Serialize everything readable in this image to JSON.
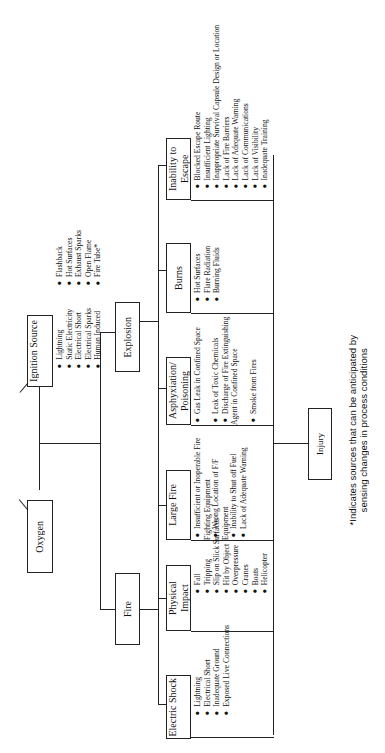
{
  "sources": {
    "oxygen": {
      "label": "Oxygen"
    },
    "ignition": {
      "label": "Ignition Source",
      "items_a": [
        "Lightning",
        "Static Electricity",
        "Electrical Short",
        "Electrical Sparks",
        "Human Induced"
      ],
      "items_b": [
        "Flashback",
        "Hot Surfaces",
        "Exhaust Sparks",
        "Open Flame",
        "Fire Tube*"
      ]
    }
  },
  "events": {
    "fire": {
      "label": "Fire"
    },
    "explosion": {
      "label": "Explosion"
    }
  },
  "categories": [
    {
      "label": "Electric Shock",
      "items": [
        "Lightning",
        "Electrical Short",
        "Inadequate Ground",
        "Exposed Live Connections"
      ]
    },
    {
      "label": "Physical Impact",
      "items": [
        "Fall",
        "Tripping",
        "Slip on Slick Surfaces",
        "Hit by Object",
        "Overpressure",
        "Cranes",
        "Boats",
        "Helicopter"
      ]
    },
    {
      "label": "Large Fire",
      "items": [
        "Insufficient or Inoperable Fire Fighting Equipment",
        "Wrong Location of F/F Equipment",
        "Inability to Shut off Fuel",
        "Lack of Adequate Warning"
      ]
    },
    {
      "label": "Asphyxiation/ Poisoning",
      "items": [
        "Gas Leak in Confined Space",
        "Leak of Toxic Chemicals",
        "Discharge of Fire Extinguishing Agent in Confined Space",
        "Smoke from Fires"
      ]
    },
    {
      "label": "Burns",
      "items": [
        "Hot Surfaces",
        "Flare Radiation",
        "Burning Fluids"
      ]
    },
    {
      "label": "Inability to Escape",
      "items": [
        "Blocked Escape Route",
        "Insufficient Lighting",
        "Inappropriate Survival Capsule Design or Location",
        "Lack of Fire Barriers",
        "Lack of Adequate Warning",
        "Lack of Communications",
        "Lack of Visibility",
        "Inadequate Training"
      ]
    }
  ],
  "outcome": {
    "label": "Injury"
  },
  "footnote": {
    "line1": "*Indicates sources that can be anticipated by",
    "line2": "sensing changes in process conditions"
  }
}
